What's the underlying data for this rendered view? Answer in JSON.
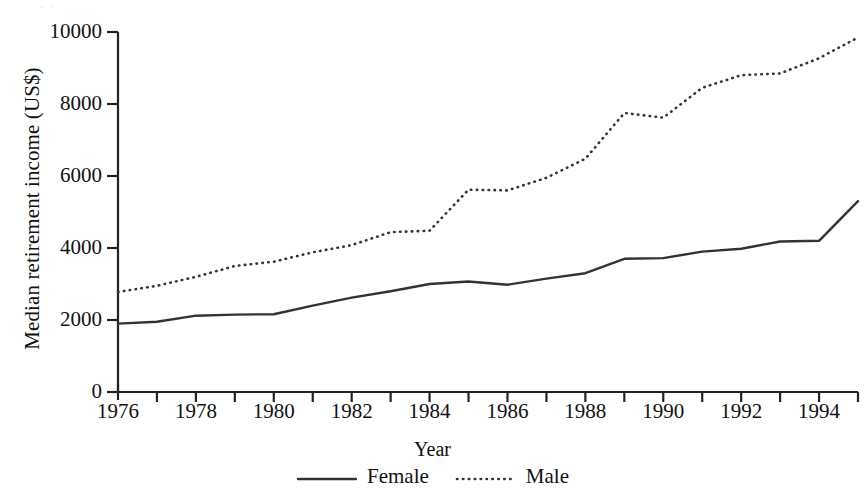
{
  "chart_data": {
    "type": "line",
    "title": "",
    "xlabel": "Year",
    "ylabel": "Median retirement income (US$)",
    "xlim": [
      1976,
      1995
    ],
    "ylim": [
      0,
      10000
    ],
    "grid": false,
    "legend_position": "bottom-center",
    "x": [
      1976,
      1977,
      1978,
      1979,
      1980,
      1981,
      1982,
      1983,
      1984,
      1985,
      1986,
      1987,
      1988,
      1989,
      1990,
      1991,
      1992,
      1993,
      1994,
      1995
    ],
    "x_tick_labels": [
      "1976",
      "1978",
      "1980",
      "1982",
      "1984",
      "1986",
      "1988",
      "1990",
      "1992",
      "1994"
    ],
    "x_tick_values": [
      1976,
      1978,
      1980,
      1982,
      1984,
      1986,
      1988,
      1990,
      1992,
      1994
    ],
    "y_tick_labels": [
      "0",
      "2000",
      "4000",
      "6000",
      "8000",
      "10000"
    ],
    "y_tick_values": [
      0,
      2000,
      4000,
      6000,
      8000,
      10000
    ],
    "series": [
      {
        "name": "Female",
        "style": "solid",
        "color": "#333333",
        "values": [
          1900,
          1950,
          2120,
          2150,
          2160,
          2400,
          2620,
          2800,
          3000,
          3070,
          2980,
          3150,
          3300,
          3700,
          3720,
          3900,
          3980,
          4180,
          4200,
          5300
        ]
      },
      {
        "name": "Male",
        "style": "dotted",
        "color": "#333333",
        "values": [
          2780,
          2950,
          3200,
          3500,
          3620,
          3880,
          4080,
          4440,
          4480,
          5620,
          5600,
          5950,
          6480,
          7750,
          7620,
          8450,
          8800,
          8850,
          9270,
          9850
        ]
      }
    ]
  },
  "axes": {
    "y_title": "Median retirement income (US$)",
    "x_title": "Year"
  },
  "legend": {
    "entries": [
      {
        "label": "Female",
        "icon": "solid-line-swatch"
      },
      {
        "label": "Male",
        "icon": "dotted-line-swatch"
      }
    ]
  }
}
